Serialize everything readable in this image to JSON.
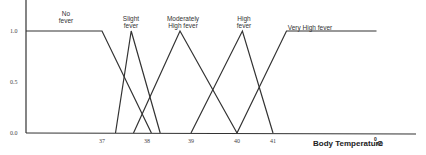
{
  "chart_data": {
    "type": "line",
    "title": "",
    "xlabel": "Body Temperature",
    "xlabel_unit": "0C",
    "ylabel": "",
    "ylim": [
      0,
      1
    ],
    "x_ticks": [
      {
        "value": 37,
        "label": "37"
      },
      {
        "value": 38,
        "label": "38"
      },
      {
        "value": 39,
        "label": "39"
      },
      {
        "value": 40,
        "label": "40"
      },
      {
        "value": 41,
        "label": "41"
      }
    ],
    "y_ticks": [
      {
        "value": 0.0,
        "label": "0.0"
      },
      {
        "value": 0.5,
        "label": "0.5"
      },
      {
        "value": 1.0,
        "label": "1.0"
      }
    ],
    "grid": false,
    "series": [
      {
        "name": "No fever",
        "label_lines": [
          "No",
          "fever"
        ],
        "points": [
          [
            35.4,
            1.0
          ],
          [
            37.0,
            1.0
          ],
          [
            38.1,
            0.0
          ]
        ]
      },
      {
        "name": "Slight fever",
        "label_lines": [
          "Slight",
          "fever"
        ],
        "points": [
          [
            37.3,
            0.0
          ],
          [
            37.65,
            1.0
          ],
          [
            38.3,
            0.0
          ]
        ]
      },
      {
        "name": "Moderately High fever",
        "label_lines": [
          "Moderately",
          "High fever"
        ],
        "points": [
          [
            37.7,
            0.0
          ],
          [
            38.75,
            1.0
          ],
          [
            40.0,
            0.0
          ]
        ]
      },
      {
        "name": "High fever",
        "label_lines": [
          "High",
          "fever"
        ],
        "points": [
          [
            39.0,
            0.0
          ],
          [
            40.15,
            1.0
          ],
          [
            41.0,
            0.0
          ]
        ]
      },
      {
        "name": "Very High fever",
        "label_lines": [
          "Very High fever"
        ],
        "points": [
          [
            40.0,
            0.0
          ],
          [
            41.3,
            1.0
          ],
          [
            43.3,
            1.0
          ]
        ]
      }
    ]
  }
}
